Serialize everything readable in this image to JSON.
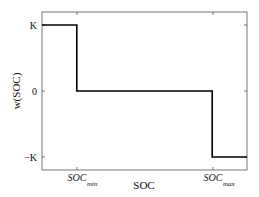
{
  "chart_data": {
    "type": "line",
    "title": "",
    "xlabel": "SOC",
    "ylabel": "w(SOC)",
    "x_ticks": [
      {
        "label": "SOC",
        "subscript": "min",
        "x": 0.17
      },
      {
        "label": "SOC",
        "subscript": "max",
        "x": 0.83
      }
    ],
    "y_ticks": [
      {
        "label": "K",
        "value": 1
      },
      {
        "label": "0",
        "value": 0
      },
      {
        "label": "−K",
        "value": -1
      }
    ],
    "xlim": [
      0,
      1
    ],
    "ylim": [
      -1.2,
      1.2
    ],
    "grid": false,
    "legend": null,
    "series": [
      {
        "name": "w(SOC)",
        "color": "#000000",
        "x": [
          0,
          0.17,
          0.17,
          0.83,
          0.83,
          1.0
        ],
        "y": [
          1,
          1,
          0,
          0,
          -1,
          -1
        ]
      }
    ]
  }
}
